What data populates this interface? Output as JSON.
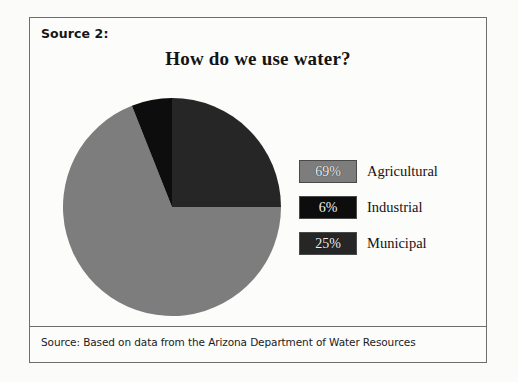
{
  "frame": {
    "source_label": "Source 2:",
    "footer": "Source: Based on data from the Arizona Department of Water Resources"
  },
  "chart_data": {
    "type": "pie",
    "title": "How do we use water?",
    "subtitle": "",
    "xlabel": "",
    "ylabel": "",
    "legend_position": "right",
    "grid": false,
    "start_angle_deg": 0,
    "direction": "clockwise",
    "categories": [
      "Municipal",
      "Industrial",
      "Agricultural"
    ],
    "values": [
      25,
      6,
      69
    ],
    "units": "percent",
    "slices": [
      {
        "label": "Municipal",
        "value": 25,
        "value_label": "25%",
        "color": "#262626",
        "start_deg": 0,
        "end_deg": 90
      },
      {
        "label": "Agricultural",
        "value": 69,
        "value_label": "69%",
        "color": "#7d7d7d",
        "start_deg": 90,
        "end_deg": 338.4
      },
      {
        "label": "Industrial",
        "value": 6,
        "value_label": "6%",
        "color": "#0d0d0d",
        "start_deg": 338.4,
        "end_deg": 360
      }
    ],
    "legend": [
      {
        "value_label": "69%",
        "label": "Agricultural",
        "color": "#7d7d7d"
      },
      {
        "value_label": "6%",
        "label": "Industrial",
        "color": "#0d0d0d"
      },
      {
        "value_label": "25%",
        "label": "Municipal",
        "color": "#262626"
      }
    ]
  },
  "colors": {
    "agricultural": "#7d7d7d",
    "industrial": "#0d0d0d",
    "municipal": "#262626",
    "frame_border": "#6e6e6e",
    "page_background": "#fbfbfa"
  }
}
